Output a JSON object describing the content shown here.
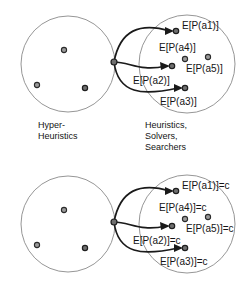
{
  "figure": {
    "title_top": "Hyper-heuristic to heuristic mapping",
    "sets": {
      "left_caption": "Hyper-\nHeuristics",
      "right_caption": "Heuristics,\nSolvers,\nSearchers"
    },
    "top_panel": {
      "labels": {
        "a1": "E[P(a1)]",
        "a4": "E[P(a4)]",
        "a5": "E[P(a5)]",
        "a2": "E[P(a2)]",
        "a3": "E[P(a3)]"
      }
    },
    "bottom_panel": {
      "labels": {
        "a1": "E[P(a1)]=c",
        "a4": "E[P(a4)]=c",
        "a5": "E[P(a5)]=c",
        "a2": "E[P(a2)]=c",
        "a3": "E[P(a3)]=c"
      }
    },
    "colors": {
      "outline": "#8a8a8a",
      "arrow": "#1a1a1a",
      "dot_fill": "#9a9a9a",
      "text": "#141414",
      "background": "#ffffff"
    }
  }
}
